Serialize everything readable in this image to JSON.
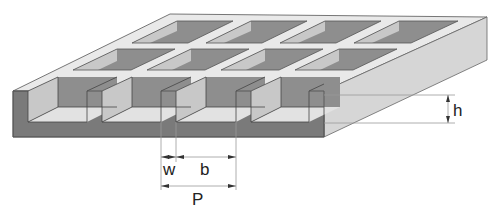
{
  "figure": {
    "labels": {
      "wall_width": "w",
      "cell_width": "b",
      "pitch": "P",
      "height": "h"
    },
    "grid": {
      "rows": 3,
      "columns": 4
    },
    "colors": {
      "top_surface": "#e9e9e9",
      "front_face": "#7a7a7a",
      "side_face": "#d4d4d4",
      "cell_back_wall": "#8e8e8e",
      "cell_side_wall": "#c8c8c8",
      "cell_floor": "#e2e2e2",
      "outline": "#555555",
      "dimension_line": "#999999"
    }
  }
}
